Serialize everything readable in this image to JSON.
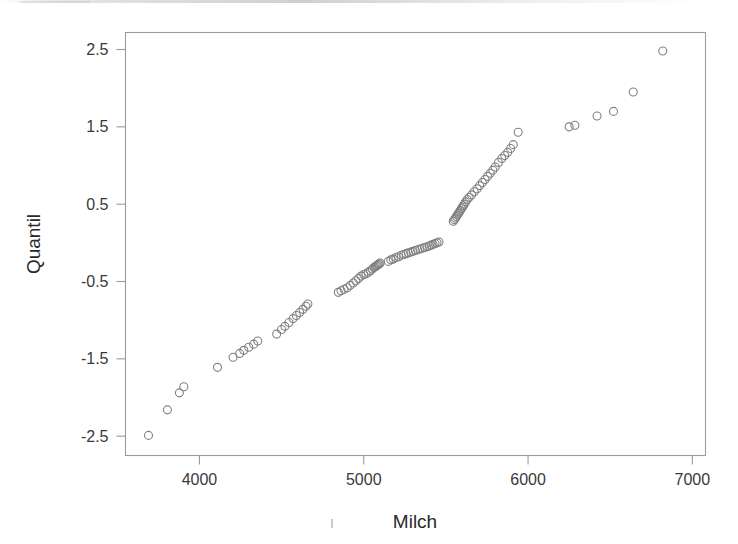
{
  "figure": {
    "kind": "qq-plot-scatter",
    "background_color": "#ffffff",
    "frame_color": "#9b9b9b",
    "marker_color": "#808080",
    "text_color": "#2a2a2a"
  },
  "chart_data": {
    "type": "scatter",
    "title": "",
    "xlabel": "Milch",
    "ylabel": "Quantil",
    "xlim": [
      3550,
      7080
    ],
    "ylim": [
      -2.75,
      2.72
    ],
    "xticks": [
      4000,
      5000,
      6000,
      7000
    ],
    "xtick_labels": [
      "4000",
      "5000",
      "6000",
      "7000"
    ],
    "yticks": [
      2.5,
      1.5,
      0.5,
      -0.5,
      -1.5,
      -2.5
    ],
    "ytick_labels": [
      "2.5",
      "1.5",
      "0.5",
      "-0.5",
      "-1.5",
      "-2.5"
    ],
    "grid": false,
    "legend": null,
    "marker": "open-circle",
    "marker_size_px": 8,
    "n_points": 103,
    "x": [
      3690,
      3805,
      3878,
      3905,
      4110,
      4205,
      4245,
      4270,
      4300,
      4330,
      4355,
      4470,
      4500,
      4520,
      4545,
      4570,
      4590,
      4610,
      4630,
      4648,
      4660,
      4845,
      4862,
      4880,
      4900,
      4918,
      4936,
      4952,
      4968,
      4984,
      5000,
      5014,
      5028,
      5040,
      5052,
      5062,
      5070,
      5076,
      5082,
      5088,
      5094,
      5100,
      5150,
      5165,
      5180,
      5196,
      5212,
      5228,
      5244,
      5258,
      5272,
      5286,
      5300,
      5314,
      5328,
      5342,
      5356,
      5370,
      5384,
      5398,
      5410,
      5422,
      5434,
      5446,
      5458,
      5545,
      5552,
      5558,
      5564,
      5570,
      5576,
      5582,
      5588,
      5594,
      5600,
      5606,
      5612,
      5620,
      5630,
      5642,
      5656,
      5672,
      5690,
      5706,
      5722,
      5738,
      5754,
      5770,
      5786,
      5800,
      5820,
      5840,
      5858,
      5876,
      5894,
      5910,
      5940,
      6250,
      6285,
      6420,
      6520,
      6640,
      6820
    ],
    "y": [
      -2.49,
      -2.16,
      -1.94,
      -1.86,
      -1.61,
      -1.48,
      -1.43,
      -1.39,
      -1.35,
      -1.31,
      -1.27,
      -1.18,
      -1.12,
      -1.08,
      -1.03,
      -0.98,
      -0.94,
      -0.9,
      -0.86,
      -0.82,
      -0.79,
      -0.64,
      -0.62,
      -0.6,
      -0.58,
      -0.55,
      -0.52,
      -0.49,
      -0.46,
      -0.43,
      -0.41,
      -0.4,
      -0.38,
      -0.36,
      -0.34,
      -0.32,
      -0.31,
      -0.3,
      -0.29,
      -0.28,
      -0.27,
      -0.26,
      -0.24,
      -0.22,
      -0.21,
      -0.19,
      -0.18,
      -0.16,
      -0.15,
      -0.14,
      -0.13,
      -0.12,
      -0.11,
      -0.1,
      -0.09,
      -0.08,
      -0.07,
      -0.06,
      -0.05,
      -0.04,
      -0.03,
      -0.02,
      -0.01,
      0.0,
      0.01,
      0.28,
      0.3,
      0.32,
      0.34,
      0.36,
      0.38,
      0.4,
      0.42,
      0.44,
      0.46,
      0.48,
      0.5,
      0.53,
      0.56,
      0.59,
      0.62,
      0.66,
      0.7,
      0.74,
      0.78,
      0.82,
      0.86,
      0.9,
      0.94,
      0.98,
      1.04,
      1.09,
      1.13,
      1.17,
      1.22,
      1.27,
      1.43,
      1.5,
      1.52,
      1.64,
      1.7,
      1.95,
      2.48
    ]
  }
}
